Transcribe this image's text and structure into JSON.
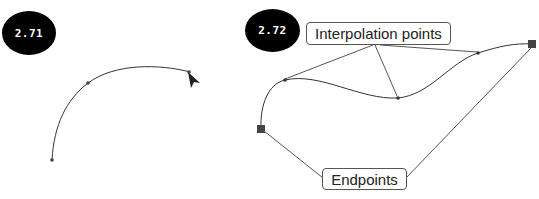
{
  "panels": [
    {
      "badge": "2.71"
    },
    {
      "badge": "2.72"
    }
  ],
  "callouts": {
    "interpolation": "Interpolation points",
    "endpoints": "Endpoints"
  },
  "colors": {
    "curve": "#333333",
    "leader": "#555555",
    "endpoint": "#444444",
    "badge": "#000000"
  }
}
